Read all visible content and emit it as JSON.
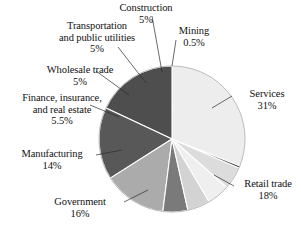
{
  "chart_data": {
    "type": "pie",
    "title": "",
    "xlabel": "",
    "ylabel": "",
    "legend_position": "callout-labels",
    "grid": false,
    "units": "percent",
    "categories": [
      "Services",
      "Retail trade",
      "Government",
      "Manufacturing",
      "Finance, insurance, and real estate",
      "Wholesale trade",
      "Transportation and public utilities",
      "Construction",
      "Mining"
    ],
    "values": [
      31,
      18,
      16,
      14,
      5.5,
      5,
      5,
      5,
      0.5
    ],
    "slices": [
      {
        "label": "Services",
        "value": 31,
        "value_text": "31%",
        "color": "#ededed"
      },
      {
        "label": "Retail trade",
        "value": 18,
        "value_text": "18%",
        "color": "#4e4e4e"
      },
      {
        "label": "Government",
        "value": 16,
        "value_text": "16%",
        "color": "#585858"
      },
      {
        "label": "Manufacturing",
        "value": 14,
        "value_text": "14%",
        "color": "#ababab"
      },
      {
        "label": "Finance, insurance, and real estate",
        "value": 5.5,
        "value_text": "5.5%",
        "color": "#7a7a7a"
      },
      {
        "label": "Wholesale trade",
        "value": 5,
        "value_text": "5%",
        "color": "#d3d3d3"
      },
      {
        "label": "Transportation and public utilities",
        "value": 5,
        "value_text": "5%",
        "color": "#efefef"
      },
      {
        "label": "Construction",
        "value": 5,
        "value_text": "5%",
        "color": "#dcdcdc"
      },
      {
        "label": "Mining",
        "value": 0.5,
        "value_text": "0.5%",
        "color": "#3a3a3a"
      }
    ]
  },
  "labels": {
    "construction": {
      "name": "Construction",
      "pct": "5%"
    },
    "mining": {
      "name": "Mining",
      "pct": "0.5%"
    },
    "transportation": {
      "line1": "Transportation",
      "line2": "and public utilities",
      "pct": "5%"
    },
    "wholesale": {
      "name": "Wholesale trade",
      "pct": "5%"
    },
    "finance": {
      "line1": "Finance, insurance,",
      "line2": "and real estate",
      "pct": "5.5%"
    },
    "manufacturing": {
      "name": "Manufacturing",
      "pct": "14%"
    },
    "government": {
      "name": "Government",
      "pct": "16%"
    },
    "services": {
      "name": "Services",
      "pct": "31%"
    },
    "retail": {
      "name": "Retail trade",
      "pct": "18%"
    }
  }
}
